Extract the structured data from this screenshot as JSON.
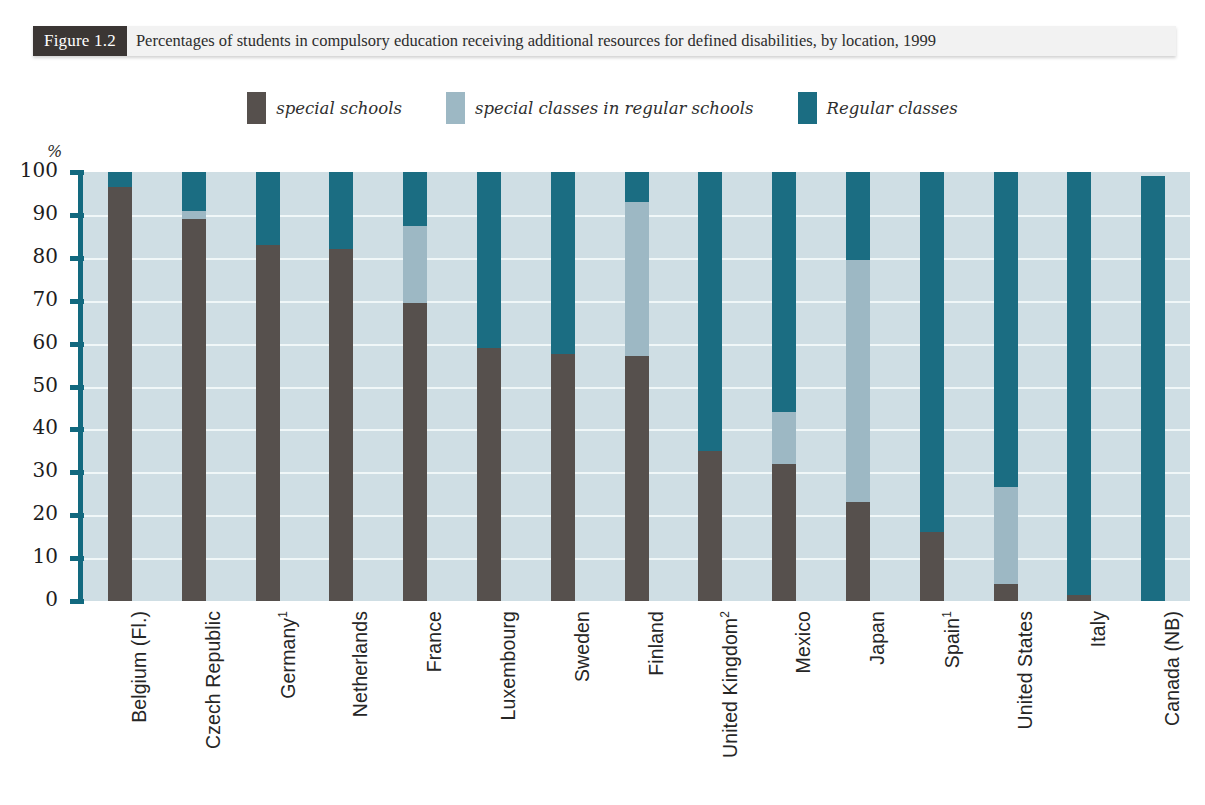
{
  "figure": {
    "tag": "Figure 1.2",
    "caption": "Percentages of students in compulsory education receiving additional resources for defined disabilities, by location, 1999"
  },
  "axis": {
    "unit_label": "%",
    "ticks": [
      "100",
      "90",
      "80",
      "70",
      "60",
      "50",
      "40",
      "30",
      "20",
      "10",
      "0"
    ]
  },
  "legend": {
    "items": [
      {
        "label": "special schools",
        "color": "#56504d",
        "key": "special_schools"
      },
      {
        "label": "special classes in regular schools",
        "color": "#9db8c4",
        "key": "special_classes"
      },
      {
        "label": "Regular classes",
        "color": "#1b6d82",
        "key": "regular_classes"
      }
    ]
  },
  "colors": {
    "special_schools": "#56504d",
    "special_classes": "#9db8c4",
    "regular_classes": "#1b6d82",
    "plot_background": "#cfdee4",
    "gridline": "#f3f8fa",
    "axis": "#12697f",
    "tag_background": "#3b3634",
    "caption_background": "#f2f2f2"
  },
  "chart_data": {
    "type": "bar",
    "stacked": true,
    "title": "Percentages of students in compulsory education receiving additional resources for defined disabilities, by location, 1999",
    "xlabel": "",
    "ylabel": "%",
    "ylim": [
      0,
      100
    ],
    "yticks": [
      0,
      10,
      20,
      30,
      40,
      50,
      60,
      70,
      80,
      90,
      100
    ],
    "grid": true,
    "legend_position": "top-center",
    "categories": [
      "Belgium (Fl.)",
      "Czech Republic",
      "Germany¹",
      "Netherlands",
      "France",
      "Luxembourg",
      "Sweden",
      "Finland",
      "United Kingdom²",
      "Mexico",
      "Japan",
      "Spain¹",
      "United States",
      "Italy",
      "Canada (NB)"
    ],
    "series": [
      {
        "name": "special schools",
        "color": "#56504d",
        "values": [
          96.5,
          89.0,
          83.0,
          82.0,
          69.5,
          59.0,
          57.5,
          57.0,
          35.0,
          32.0,
          23.0,
          16.0,
          4.0,
          1.5,
          0.0
        ]
      },
      {
        "name": "special classes in regular schools",
        "color": "#9db8c4",
        "values": [
          0.0,
          2.0,
          0.0,
          0.0,
          18.0,
          0.0,
          0.0,
          36.0,
          0.0,
          12.0,
          56.5,
          0.0,
          22.5,
          0.0,
          0.0
        ]
      },
      {
        "name": "Regular classes",
        "color": "#1b6d82",
        "values": [
          3.5,
          9.0,
          17.0,
          18.0,
          12.5,
          41.0,
          42.5,
          7.0,
          65.0,
          56.0,
          20.5,
          84.0,
          73.5,
          98.5,
          99.0
        ]
      }
    ]
  }
}
